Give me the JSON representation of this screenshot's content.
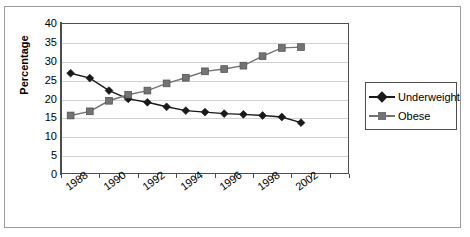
{
  "chart_data": {
    "type": "line",
    "title": "",
    "xlabel": "",
    "ylabel": "Percentage",
    "ylim": [
      0,
      40
    ],
    "ytick_step": 5,
    "ytick_labels": [
      "40",
      "35",
      "30",
      "25",
      "20",
      "15",
      "10",
      "5",
      "0"
    ],
    "grid": true,
    "legend_position": "right",
    "x_tick_labels_visible": [
      "1988",
      "1990",
      "1992",
      "1994",
      "1996",
      "1998",
      "2002"
    ],
    "x": [
      1988,
      1989,
      1990,
      1991,
      1992,
      1993,
      1994,
      1995,
      1996,
      1997,
      1998,
      1999,
      2000,
      2001,
      2002
    ],
    "categories": [
      "1988",
      "1989",
      "1990",
      "1991",
      "1992",
      "1993",
      "1994",
      "1995",
      "1996",
      "1997",
      "1998",
      "1999",
      "2000",
      "2001",
      "2002"
    ],
    "series": [
      {
        "name": "Underweight",
        "marker": "diamond",
        "color": "#1a1a1a",
        "values": [
          26.7,
          25.4,
          22.1,
          19.9,
          19.0,
          17.8,
          16.8,
          16.4,
          16.0,
          15.8,
          15.5,
          15.1,
          13.6,
          null,
          null
        ]
      },
      {
        "name": "Obese",
        "marker": "square",
        "color": "#737373",
        "values": [
          15.5,
          16.6,
          19.4,
          21.0,
          22.1,
          24.0,
          25.5,
          27.2,
          27.8,
          28.7,
          31.2,
          33.4,
          33.6,
          null,
          null
        ]
      }
    ]
  },
  "legend": {
    "items": [
      {
        "label": "Underweight",
        "marker": "diamond",
        "color": "#1a1a1a"
      },
      {
        "label": "Obese",
        "marker": "square",
        "color": "#737373"
      }
    ]
  },
  "axis": {
    "y_title": "Percentage",
    "y_labels": [
      "40",
      "35",
      "30",
      "25",
      "20",
      "15",
      "10",
      "5",
      "0"
    ],
    "x_labels": [
      "1988",
      "1990",
      "1992",
      "1994",
      "1996",
      "1998",
      "2002"
    ]
  },
  "colors": {
    "underweight": "#1a1a1a",
    "obese": "#737373",
    "grid": "#d2d2d2",
    "axis": "#4d4d4d",
    "border": "#9a9a9a"
  }
}
